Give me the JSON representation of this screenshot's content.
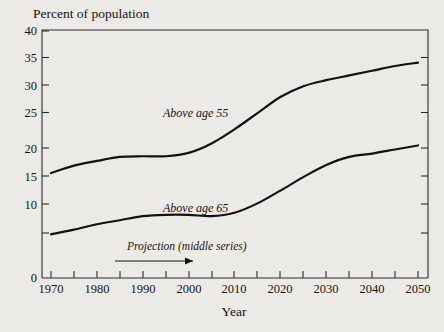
{
  "chart_data": {
    "type": "line",
    "title": "",
    "ylabel": "Percent of population",
    "xlabel": "Year",
    "xlim": [
      1970,
      2050
    ],
    "ylim": [
      10,
      40
    ],
    "y_axis_break_label": "0",
    "grid": false,
    "legend_position": "inline-annotations",
    "xticks": [
      1970,
      1975,
      1980,
      1985,
      1990,
      1995,
      2000,
      2005,
      2010,
      2015,
      2020,
      2025,
      2030,
      2035,
      2040,
      2045,
      2050
    ],
    "xtick_labels": [
      "1970",
      "",
      "1980",
      "",
      "1990",
      "",
      "2000",
      "",
      "2010",
      "",
      "2020",
      "",
      "2030",
      "",
      "2040",
      "",
      "2050"
    ],
    "yticks": [
      0,
      10,
      15,
      20,
      25,
      30,
      35,
      40
    ],
    "ytick_labels": [
      "0",
      "10",
      "15",
      "20",
      "25",
      "30",
      "35",
      "40"
    ],
    "x": [
      1970,
      1975,
      1980,
      1985,
      1990,
      1995,
      2000,
      2005,
      2010,
      2015,
      2020,
      2025,
      2030,
      2035,
      2040,
      2045,
      2050
    ],
    "series": [
      {
        "name": "Above age 55",
        "label": "Above age 55",
        "values": [
          18.9,
          20.0,
          20.7,
          21.3,
          21.4,
          21.4,
          21.9,
          23.3,
          25.4,
          27.8,
          30.2,
          31.8,
          32.7,
          33.4,
          34.1,
          34.8,
          35.3
        ]
      },
      {
        "name": "Above age 65",
        "label": "Above age 65",
        "values": [
          9.8,
          10.5,
          11.3,
          11.9,
          12.5,
          12.7,
          12.7,
          12.5,
          13.0,
          14.4,
          16.3,
          18.3,
          20.1,
          21.3,
          21.8,
          22.4,
          23.0
        ]
      }
    ],
    "annotations": [
      {
        "text": "Projection (middle series)",
        "type": "arrow-label",
        "arrow_from_year": 1990,
        "arrow_to_year": 2010
      }
    ],
    "colors": {
      "background": "#eceae6",
      "line": "#111111",
      "axis": "#2a2a2a",
      "text": "#141414"
    }
  }
}
